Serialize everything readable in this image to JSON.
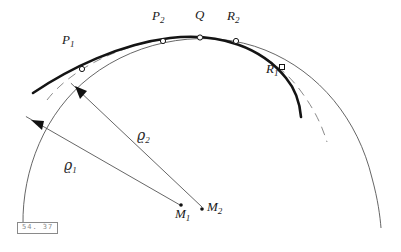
{
  "figure": {
    "number_label": "54. 37",
    "background_color": "#ffffff",
    "ink_color": "#1a1a1a",
    "thin_line_color": "#555555",
    "dashed_line_color": "#777777"
  },
  "point_labels": [
    {
      "id": "P1",
      "base": "P",
      "sub": "1",
      "x": 62,
      "y": 37
    },
    {
      "id": "P2",
      "base": "P",
      "sub": "2",
      "x": 152,
      "y": 14
    },
    {
      "id": "Q",
      "base": "Q",
      "sub": "",
      "x": 196,
      "y": 11
    },
    {
      "id": "R2",
      "base": "R",
      "sub": "2",
      "x": 228,
      "y": 14
    },
    {
      "id": "R1",
      "base": "R",
      "sub": "1",
      "x": 270,
      "y": 66
    },
    {
      "id": "M1",
      "base": "M",
      "sub": "1",
      "x": 182,
      "y": 213
    },
    {
      "id": "M2",
      "base": "M",
      "sub": "2",
      "x": 208,
      "y": 203
    }
  ],
  "radius_labels": [
    {
      "id": "rho1",
      "glyph": "ϱ",
      "sub": "1",
      "x": 66,
      "y": 163
    },
    {
      "id": "rho2",
      "glyph": "ϱ",
      "sub": "2",
      "x": 139,
      "y": 133
    }
  ],
  "markers": [
    {
      "id": "marker-P1",
      "shape": "circle",
      "x": 82,
      "y": 69
    },
    {
      "id": "marker-P2",
      "shape": "circle",
      "x": 163,
      "y": 41
    },
    {
      "id": "marker-Q",
      "shape": "circle",
      "x": 200,
      "y": 38
    },
    {
      "id": "marker-R2",
      "shape": "circle",
      "x": 236,
      "y": 41
    },
    {
      "id": "marker-R1",
      "shape": "square",
      "x": 282,
      "y": 67
    },
    {
      "id": "marker-M1",
      "shape": "dot",
      "x": 181,
      "y": 205
    },
    {
      "id": "marker-M2",
      "shape": "dot",
      "x": 202,
      "y": 209
    }
  ],
  "curves": {
    "main_curve": {
      "name": "thick-curve",
      "path": "M 33,93 C 70,68 120,44 170,38 C 220,32 262,48 286,78 C 296,90 300,105 301,117"
    },
    "dashed_arc": {
      "name": "osculating-circle-rho2",
      "path": "M 47,100 C 70,70 120,44 172,38 C 224,32 272,52 300,90 C 315,110 322,126 327,142"
    },
    "thin_arc": {
      "name": "osculating-circle-rho1",
      "path": "M 23,225 C 22,170 45,112 90,77 C 140,38 210,28 265,50 C 320,72 358,120 372,178 C 378,200 380,216 381,228"
    }
  },
  "radius_lines": [
    {
      "id": "radius-line-rho1",
      "from_x": 180,
      "from_y": 205,
      "to_x": 32,
      "to_y": 120,
      "arrow": true
    },
    {
      "id": "radius-line-rho2",
      "from_x": 202,
      "from_y": 207,
      "to_x": 76,
      "to_y": 88,
      "arrow": true
    }
  ]
}
